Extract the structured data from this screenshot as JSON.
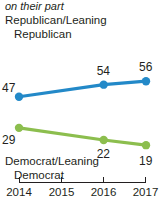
{
  "caption": {
    "continued_text": "on their part"
  },
  "legend": {
    "republican": {
      "line1": "Republican/Leaning",
      "line2": "Republican"
    },
    "democrat": {
      "line1": "Democrat/Leaning",
      "line2": "Democrat"
    }
  },
  "colors": {
    "republican": "#2389c8",
    "democrat": "#8cbe4e",
    "text": "#231f20",
    "axis": "#231f20",
    "background": "#ffffff"
  },
  "chart_data": {
    "type": "line",
    "title": "",
    "subtitle": "on their part",
    "xlabel": "",
    "ylabel": "",
    "grid": false,
    "legend_position": "inline-above-and-below-series",
    "x": [
      "2014",
      "2016",
      "2017"
    ],
    "categories": [
      "2014",
      "2015",
      "2016",
      "2017"
    ],
    "axis_tick_labels": [
      "2014",
      "2015",
      "2016",
      "2017"
    ],
    "xlim": [
      2014,
      2017
    ],
    "ylim": [
      0,
      70
    ],
    "series": [
      {
        "name": "Republican/Leaning Republican",
        "color": "#2389c8",
        "x": [
          2014,
          2016,
          2017
        ],
        "values": [
          47,
          54,
          56
        ],
        "point_labels": [
          "47",
          "54",
          "56"
        ]
      },
      {
        "name": "Democrat/Leaning Democrat",
        "color": "#8cbe4e",
        "x": [
          2014,
          2016,
          2017
        ],
        "values": [
          29,
          22,
          19
        ],
        "point_labels": [
          "29",
          "22",
          "19"
        ]
      }
    ]
  }
}
